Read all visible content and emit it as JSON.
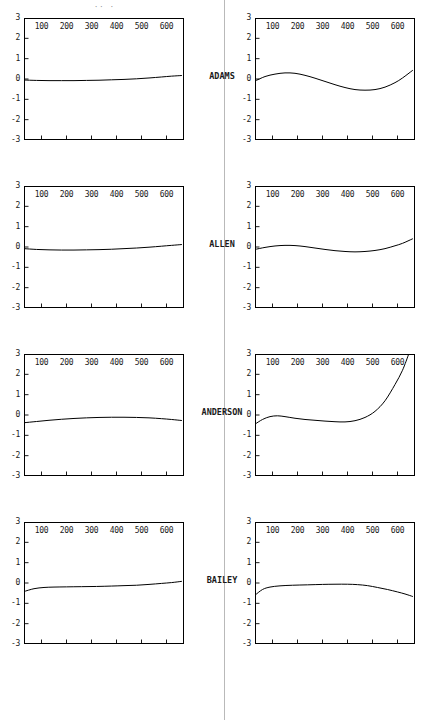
{
  "page": {
    "top_artifact": "·· ·",
    "divider": true
  },
  "chart_data": {
    "type": "line",
    "title": "",
    "xlabel": "",
    "ylabel": "",
    "xlim": [
      30,
      670
    ],
    "ylim": [
      -3,
      3
    ],
    "grid": false,
    "legend": "none",
    "yticks": [
      3,
      2,
      1,
      0,
      -1,
      -2,
      -3
    ],
    "ytick_labels": [
      "3",
      "2",
      "1",
      "0",
      "-1",
      "-2",
      "-3"
    ],
    "xticks": [
      100,
      200,
      300,
      400,
      500,
      600
    ],
    "xtick_labels": [
      "100",
      "200",
      "300",
      "400",
      "500",
      "600"
    ],
    "panel_rows": [
      {
        "row_label": "ADAMS",
        "panels": [
          {
            "side": "left",
            "x": [
              30,
              80,
              130,
              180,
              230,
              280,
              330,
              380,
              430,
              480,
              530,
              580,
              620,
              660
            ],
            "y": [
              -0.05,
              -0.07,
              -0.08,
              -0.08,
              -0.08,
              -0.07,
              -0.06,
              -0.04,
              -0.02,
              0.01,
              0.05,
              0.1,
              0.14,
              0.17
            ]
          },
          {
            "side": "right",
            "x": [
              30,
              70,
              110,
              150,
              190,
              230,
              270,
              310,
              350,
              390,
              430,
              470,
              510,
              550,
              590,
              620,
              660
            ],
            "y": [
              -0.1,
              0.12,
              0.24,
              0.3,
              0.28,
              0.18,
              0.04,
              -0.12,
              -0.28,
              -0.42,
              -0.52,
              -0.55,
              -0.52,
              -0.4,
              -0.18,
              0.05,
              0.42
            ]
          }
        ]
      },
      {
        "row_label": "ALLEN",
        "panels": [
          {
            "side": "left",
            "x": [
              30,
              80,
              130,
              180,
              230,
              280,
              330,
              380,
              430,
              480,
              530,
              580,
              620,
              660
            ],
            "y": [
              -0.08,
              -0.12,
              -0.14,
              -0.15,
              -0.15,
              -0.14,
              -0.13,
              -0.11,
              -0.08,
              -0.05,
              -0.01,
              0.04,
              0.08,
              0.12
            ]
          },
          {
            "side": "right",
            "x": [
              30,
              70,
              110,
              150,
              190,
              230,
              270,
              310,
              350,
              390,
              430,
              470,
              510,
              550,
              590,
              620,
              660
            ],
            "y": [
              -0.12,
              -0.02,
              0.05,
              0.08,
              0.07,
              0.02,
              -0.05,
              -0.12,
              -0.18,
              -0.22,
              -0.24,
              -0.22,
              -0.17,
              -0.08,
              0.06,
              0.18,
              0.4
            ]
          }
        ]
      },
      {
        "row_label": "ANDERSON",
        "panels": [
          {
            "side": "left",
            "x": [
              30,
              80,
              130,
              180,
              230,
              280,
              330,
              380,
              430,
              480,
              530,
              580,
              620,
              660
            ],
            "y": [
              -0.38,
              -0.32,
              -0.26,
              -0.21,
              -0.17,
              -0.14,
              -0.12,
              -0.11,
              -0.11,
              -0.12,
              -0.14,
              -0.18,
              -0.22,
              -0.27
            ]
          },
          {
            "side": "right",
            "x": [
              30,
              60,
              90,
              120,
              150,
              190,
              230,
              270,
              310,
              350,
              390,
              430,
              470,
              510,
              550,
              590,
              620,
              645
            ],
            "y": [
              -0.45,
              -0.22,
              -0.08,
              -0.04,
              -0.08,
              -0.16,
              -0.22,
              -0.26,
              -0.3,
              -0.33,
              -0.34,
              -0.28,
              -0.12,
              0.18,
              0.7,
              1.5,
              2.2,
              3.0
            ]
          }
        ]
      },
      {
        "row_label": "BAILEY",
        "panels": [
          {
            "side": "left",
            "x": [
              30,
              70,
              110,
              150,
              200,
              260,
              320,
              380,
              430,
              480,
              530,
              580,
              620,
              660
            ],
            "y": [
              -0.42,
              -0.28,
              -0.22,
              -0.2,
              -0.19,
              -0.18,
              -0.17,
              -0.15,
              -0.13,
              -0.11,
              -0.07,
              -0.02,
              0.02,
              0.08
            ]
          },
          {
            "side": "right",
            "x": [
              30,
              60,
              90,
              130,
              180,
              240,
              300,
              350,
              400,
              440,
              480,
              520,
              560,
              600,
              630,
              660
            ],
            "y": [
              -0.6,
              -0.32,
              -0.2,
              -0.14,
              -0.11,
              -0.09,
              -0.07,
              -0.06,
              -0.06,
              -0.08,
              -0.13,
              -0.22,
              -0.32,
              -0.44,
              -0.54,
              -0.66
            ]
          }
        ]
      }
    ]
  }
}
